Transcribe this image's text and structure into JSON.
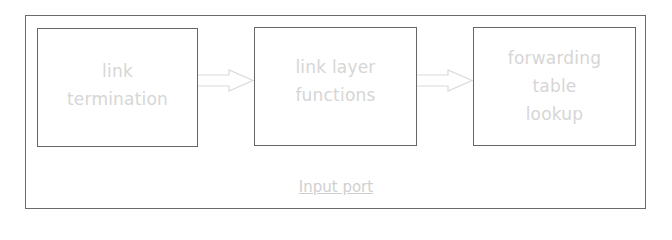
{
  "diagram": {
    "container": {
      "label": "Input port"
    },
    "blocks": [
      {
        "id": "box1",
        "label": "link\ntermination"
      },
      {
        "id": "box2",
        "label": "link layer\nfunctions"
      },
      {
        "id": "box3",
        "label": "forwarding\ntable\nlookup"
      }
    ],
    "arrows": [
      {
        "from": "link termination",
        "to": "link layer functions"
      },
      {
        "from": "link layer functions",
        "to": "forwarding table lookup"
      }
    ],
    "colors": {
      "border": "#666666",
      "text": "#d6d6d6",
      "background": "#ffffff"
    }
  }
}
